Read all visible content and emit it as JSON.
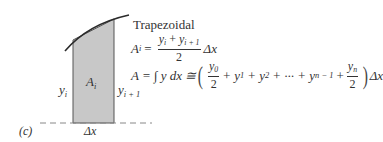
{
  "figure": {
    "panel_label": "(c)",
    "method_title": "Trapezoidal",
    "labels": {
      "left_height": {
        "base": "y",
        "sub": "i"
      },
      "right_height": {
        "base": "y",
        "sub": "i + 1"
      },
      "area": {
        "base": "A",
        "sub": "i"
      },
      "width": "Δx"
    },
    "colors": {
      "fill": "#c8c8c8",
      "stroke": "#333333",
      "curve": "#2a2a2a",
      "baseline": "#888888"
    }
  },
  "equations": {
    "area_i": {
      "lhs": "A",
      "lhs_sub": "i",
      "eq": "=",
      "num": "y",
      "num_sub1": "i",
      "plus": "+",
      "num_sub2": "i + 1",
      "den": "2",
      "tail": "Δx"
    },
    "total": {
      "lhs": "A = ∫ y dx ≅",
      "f1_num": "y",
      "f1_sub": "0",
      "f1_den": "2",
      "mid": "+ y",
      "s1": "1",
      "mid2": "+ y",
      "s2": "2",
      "mid3": "+ ··· + y",
      "s3": "n − 1",
      "plus": "+",
      "f2_num": "y",
      "f2_sub": "n",
      "f2_den": "2",
      "tail": "Δx"
    }
  }
}
